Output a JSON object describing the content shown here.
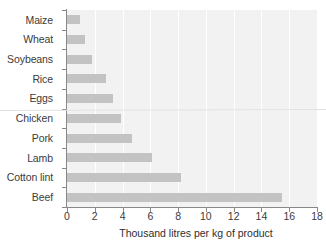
{
  "chart_data": {
    "type": "bar",
    "orientation": "horizontal",
    "title": "",
    "subtitle": "",
    "xlabel": "Thousand litres per kg of product",
    "ylabel": "",
    "categories": [
      "Maize",
      "Wheat",
      "Soybeans",
      "Rice",
      "Eggs",
      "Chicken",
      "Pork",
      "Lamb",
      "Cotton lint",
      "Beef"
    ],
    "values": [
      0.9,
      1.3,
      1.8,
      2.8,
      3.3,
      3.9,
      4.7,
      6.1,
      8.2,
      15.5
    ],
    "xlim": [
      0,
      18
    ],
    "xticks": [
      0,
      2,
      4,
      6,
      8,
      10,
      12,
      14,
      16,
      18
    ],
    "xtick_labels": [
      "0",
      "2",
      "4",
      "6",
      "8",
      "10",
      "12",
      "14",
      "16",
      "18"
    ],
    "grid": "vertical-white-on-gray",
    "legend": "none",
    "bar_color": "#c3c3c3",
    "plot_background": "#f2f2f2",
    "axis_color": "#888888",
    "text_color": "#3b3b3b"
  }
}
